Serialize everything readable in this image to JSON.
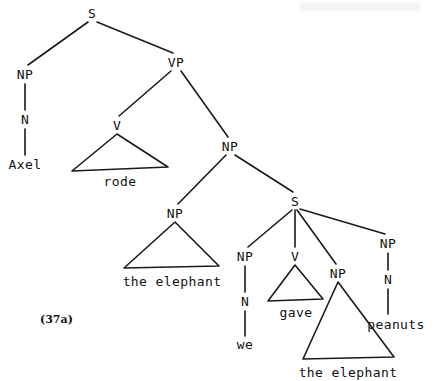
{
  "figure": {
    "number_label": "(37a)",
    "caption": "",
    "sentence": "Axel rode the elephant we gave the elephant peanuts"
  },
  "tree": {
    "nodes": [
      {
        "id": "s-root",
        "label": "S",
        "x": 92,
        "y": 13
      },
      {
        "id": "np-subj",
        "label": "NP",
        "x": 25,
        "y": 74
      },
      {
        "id": "n-subj",
        "label": "N",
        "x": 25,
        "y": 119
      },
      {
        "id": "vp",
        "label": "VP",
        "x": 176,
        "y": 62
      },
      {
        "id": "v-rode",
        "label": "V",
        "x": 117,
        "y": 125
      },
      {
        "id": "np-obj",
        "label": "NP",
        "x": 230,
        "y": 146
      },
      {
        "id": "np-head",
        "label": "NP",
        "x": 175,
        "y": 213
      },
      {
        "id": "s-rel",
        "label": "S",
        "x": 295,
        "y": 201
      },
      {
        "id": "np-we",
        "label": "NP",
        "x": 245,
        "y": 256
      },
      {
        "id": "n-we",
        "label": "N",
        "x": 245,
        "y": 301
      },
      {
        "id": "v-gave",
        "label": "V",
        "x": 295,
        "y": 256
      },
      {
        "id": "np-elephant2",
        "label": "NP",
        "x": 338,
        "y": 273
      },
      {
        "id": "np-peanuts",
        "label": "NP",
        "x": 388,
        "y": 243
      },
      {
        "id": "n-peanuts",
        "label": "N",
        "x": 388,
        "y": 279
      }
    ],
    "leaves": [
      {
        "id": "leaf-axel",
        "text": "Axel",
        "x": 25,
        "y": 164
      },
      {
        "id": "leaf-rode",
        "text": "rode",
        "x": 120,
        "y": 181
      },
      {
        "id": "leaf-elephant1",
        "text": "the elephant",
        "x": 172,
        "y": 281
      },
      {
        "id": "leaf-we",
        "text": "we",
        "x": 245,
        "y": 344
      },
      {
        "id": "leaf-gave",
        "text": "gave",
        "x": 296,
        "y": 312
      },
      {
        "id": "leaf-elephant2",
        "text": "the elephant",
        "x": 348,
        "y": 372
      },
      {
        "id": "leaf-peanuts",
        "text": "peanuts",
        "x": 396,
        "y": 324
      }
    ],
    "edges": [
      {
        "id": "e-s-np",
        "from": "s-root",
        "to": "np-subj",
        "x1": 88,
        "y1": 22,
        "x2": 28,
        "y2": 65
      },
      {
        "id": "e-s-vp",
        "from": "s-root",
        "to": "vp",
        "x1": 97,
        "y1": 22,
        "x2": 173,
        "y2": 53
      },
      {
        "id": "e-np-n",
        "from": "np-subj",
        "to": "n-subj",
        "x1": 25,
        "y1": 84,
        "x2": 25,
        "y2": 110
      },
      {
        "id": "e-n-axel",
        "from": "n-subj",
        "to": "leaf-axel",
        "x1": 25,
        "y1": 129,
        "x2": 25,
        "y2": 155
      },
      {
        "id": "e-vp-v",
        "from": "vp",
        "to": "v-rode",
        "x1": 171,
        "y1": 71,
        "x2": 119,
        "y2": 116
      },
      {
        "id": "e-vp-np",
        "from": "vp",
        "to": "np-obj",
        "x1": 181,
        "y1": 71,
        "x2": 228,
        "y2": 137
      },
      {
        "id": "e-np-nphead",
        "from": "np-obj",
        "to": "np-head",
        "x1": 226,
        "y1": 155,
        "x2": 178,
        "y2": 204
      },
      {
        "id": "e-np-srel",
        "from": "np-obj",
        "to": "s-rel",
        "x1": 235,
        "y1": 155,
        "x2": 293,
        "y2": 192
      },
      {
        "id": "e-srel-npwe",
        "from": "s-rel",
        "to": "np-we",
        "x1": 292,
        "y1": 210,
        "x2": 248,
        "y2": 247
      },
      {
        "id": "e-srel-vgave",
        "from": "s-rel",
        "to": "v-gave",
        "x1": 295,
        "y1": 210,
        "x2": 295,
        "y2": 247
      },
      {
        "id": "e-srel-npele",
        "from": "s-rel",
        "to": "np-elephant2",
        "x1": 297,
        "y1": 210,
        "x2": 336,
        "y2": 264
      },
      {
        "id": "e-srel-nppea",
        "from": "s-rel",
        "to": "np-peanuts",
        "x1": 300,
        "y1": 209,
        "x2": 385,
        "y2": 234
      },
      {
        "id": "e-npwe-nwe",
        "from": "np-we",
        "to": "n-we",
        "x1": 245,
        "y1": 266,
        "x2": 245,
        "y2": 292
      },
      {
        "id": "e-nwe-we",
        "from": "n-we",
        "to": "leaf-we",
        "x1": 245,
        "y1": 311,
        "x2": 245,
        "y2": 336
      },
      {
        "id": "e-nppea-npea",
        "from": "np-peanuts",
        "to": "n-peanuts",
        "x1": 388,
        "y1": 253,
        "x2": 388,
        "y2": 270
      },
      {
        "id": "e-npea-peanuts",
        "from": "n-peanuts",
        "to": "leaf-peanuts",
        "x1": 388,
        "y1": 289,
        "x2": 388,
        "y2": 314
      }
    ],
    "triangles": [
      {
        "id": "tri-rode",
        "label_for": "rode",
        "apex_x": 117,
        "apex_y": 134,
        "left_x": 72,
        "left_y": 171,
        "right_x": 168,
        "right_y": 167
      },
      {
        "id": "tri-elephant1",
        "label_for": "the elephant",
        "apex_x": 175,
        "apex_y": 222,
        "left_x": 124,
        "left_y": 268,
        "right_x": 219,
        "right_y": 266
      },
      {
        "id": "tri-gave",
        "label_for": "gave",
        "apex_x": 295,
        "apex_y": 265,
        "left_x": 268,
        "left_y": 301,
        "right_x": 323,
        "right_y": 299
      },
      {
        "id": "tri-elephant2",
        "label_for": "the elephant",
        "apex_x": 338,
        "apex_y": 282,
        "left_x": 303,
        "left_y": 359,
        "right_x": 394,
        "right_y": 357
      }
    ]
  },
  "colors": {
    "ink": "#1a1a1a",
    "paper": "#ffffff"
  }
}
